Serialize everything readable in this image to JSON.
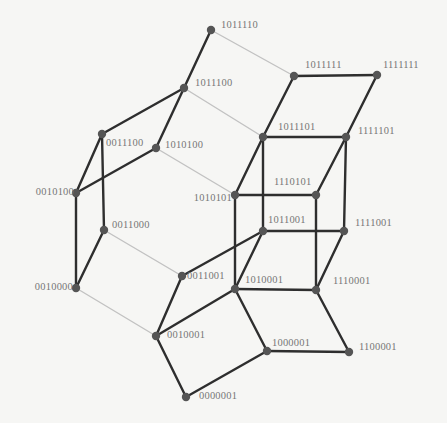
{
  "diagram": {
    "type": "graph",
    "colors": {
      "dark_edge": "#2e2e2e",
      "light_edge": "#c2c2c2",
      "node": "#555555",
      "label": "#777777"
    },
    "nodes": [
      {
        "id": "1011110",
        "x": 211,
        "y": 30,
        "label": "1011110",
        "lx": 221,
        "ly": 20,
        "align": "left"
      },
      {
        "id": "1011100",
        "x": 184,
        "y": 88,
        "label": "1011100",
        "lx": 195,
        "ly": 78,
        "align": "left"
      },
      {
        "id": "1011111",
        "x": 294,
        "y": 76,
        "label": "1011111",
        "lx": 305,
        "ly": 60,
        "align": "left"
      },
      {
        "id": "1111111",
        "x": 377,
        "y": 75,
        "label": "1111111",
        "lx": 383,
        "ly": 60,
        "align": "left"
      },
      {
        "id": "0011100",
        "x": 102,
        "y": 134,
        "label": "0011100",
        "lx": 106,
        "ly": 138,
        "align": "left"
      },
      {
        "id": "1010100",
        "x": 156,
        "y": 148,
        "label": "1010100",
        "lx": 165,
        "ly": 140,
        "align": "left"
      },
      {
        "id": "1011101",
        "x": 263,
        "y": 137,
        "label": "1011101",
        "lx": 278,
        "ly": 122,
        "align": "left"
      },
      {
        "id": "1111101",
        "x": 346,
        "y": 137,
        "label": "1111101",
        "lx": 358,
        "ly": 126,
        "align": "left"
      },
      {
        "id": "0010100",
        "x": 76,
        "y": 193,
        "label": "0010100",
        "lx": 74,
        "ly": 187,
        "align": "right"
      },
      {
        "id": "1010101",
        "x": 235,
        "y": 195,
        "label": "1010101",
        "lx": 232,
        "ly": 193,
        "align": "right"
      },
      {
        "id": "1110101",
        "x": 316,
        "y": 195,
        "label": "1110101",
        "lx": 274,
        "ly": 177,
        "align": "left"
      },
      {
        "id": "0011000",
        "x": 104,
        "y": 230,
        "label": "0011000",
        "lx": 112,
        "ly": 220,
        "align": "left"
      },
      {
        "id": "1011001",
        "x": 263,
        "y": 231,
        "label": "1011001",
        "lx": 268,
        "ly": 215,
        "align": "left"
      },
      {
        "id": "1111001",
        "x": 344,
        "y": 231,
        "label": "1111001",
        "lx": 355,
        "ly": 218,
        "align": "left"
      },
      {
        "id": "0010000",
        "x": 76,
        "y": 288,
        "label": "0010000",
        "lx": 73,
        "ly": 282,
        "align": "right"
      },
      {
        "id": "0011001",
        "x": 182,
        "y": 276,
        "label": "0011001",
        "lx": 187,
        "ly": 271,
        "align": "left"
      },
      {
        "id": "1010001",
        "x": 235,
        "y": 289,
        "label": "1010001",
        "lx": 245,
        "ly": 275,
        "align": "left"
      },
      {
        "id": "1110001",
        "x": 316,
        "y": 290,
        "label": "1110001",
        "lx": 333,
        "ly": 276,
        "align": "left"
      },
      {
        "id": "0010001",
        "x": 156,
        "y": 336,
        "label": "0010001",
        "lx": 167,
        "ly": 330,
        "align": "left"
      },
      {
        "id": "1000001",
        "x": 267,
        "y": 351,
        "label": "1000001",
        "lx": 272,
        "ly": 338,
        "align": "left"
      },
      {
        "id": "1100001",
        "x": 349,
        "y": 352,
        "label": "1100001",
        "lx": 359,
        "ly": 342,
        "align": "left"
      },
      {
        "id": "0000001",
        "x": 186,
        "y": 397,
        "label": "0000001",
        "lx": 199,
        "ly": 391,
        "align": "left"
      }
    ],
    "edges": [
      {
        "from": "1011110",
        "to": "1011100",
        "style": "dark"
      },
      {
        "from": "1011110",
        "to": "1011111",
        "style": "light"
      },
      {
        "from": "1011111",
        "to": "1111111",
        "style": "dark"
      },
      {
        "from": "1011111",
        "to": "1011101",
        "style": "dark"
      },
      {
        "from": "1111111",
        "to": "1111101",
        "style": "dark"
      },
      {
        "from": "1011100",
        "to": "0011100",
        "style": "dark"
      },
      {
        "from": "1011100",
        "to": "1010100",
        "style": "dark"
      },
      {
        "from": "1011100",
        "to": "1011101",
        "style": "light"
      },
      {
        "from": "0011100",
        "to": "0010100",
        "style": "dark"
      },
      {
        "from": "0011100",
        "to": "0011000",
        "style": "dark"
      },
      {
        "from": "1010100",
        "to": "0010100",
        "style": "dark"
      },
      {
        "from": "1010100",
        "to": "1010101",
        "style": "light"
      },
      {
        "from": "0010100",
        "to": "0010000",
        "style": "dark"
      },
      {
        "from": "0011000",
        "to": "0010000",
        "style": "dark"
      },
      {
        "from": "0011000",
        "to": "0011001",
        "style": "light"
      },
      {
        "from": "0010000",
        "to": "0010001",
        "style": "light"
      },
      {
        "from": "1011101",
        "to": "1111101",
        "style": "dark"
      },
      {
        "from": "1011101",
        "to": "1010101",
        "style": "dark"
      },
      {
        "from": "1011101",
        "to": "1011001",
        "style": "dark"
      },
      {
        "from": "1111101",
        "to": "1110101",
        "style": "dark"
      },
      {
        "from": "1111101",
        "to": "1111001",
        "style": "dark"
      },
      {
        "from": "1010101",
        "to": "1110101",
        "style": "dark"
      },
      {
        "from": "1010101",
        "to": "1010001",
        "style": "dark"
      },
      {
        "from": "1110101",
        "to": "1110001",
        "style": "dark"
      },
      {
        "from": "1011001",
        "to": "1111001",
        "style": "dark"
      },
      {
        "from": "1011001",
        "to": "1010001",
        "style": "dark"
      },
      {
        "from": "1011001",
        "to": "0011001",
        "style": "dark"
      },
      {
        "from": "1111001",
        "to": "1110001",
        "style": "dark"
      },
      {
        "from": "1010001",
        "to": "1110001",
        "style": "dark"
      },
      {
        "from": "1010001",
        "to": "0010001",
        "style": "dark"
      },
      {
        "from": "1010001",
        "to": "1000001",
        "style": "dark"
      },
      {
        "from": "0011001",
        "to": "0010001",
        "style": "dark"
      },
      {
        "from": "1110001",
        "to": "1100001",
        "style": "dark"
      },
      {
        "from": "1000001",
        "to": "1100001",
        "style": "dark"
      },
      {
        "from": "0010001",
        "to": "0000001",
        "style": "dark"
      },
      {
        "from": "0000001",
        "to": "1000001",
        "style": "dark"
      }
    ]
  }
}
